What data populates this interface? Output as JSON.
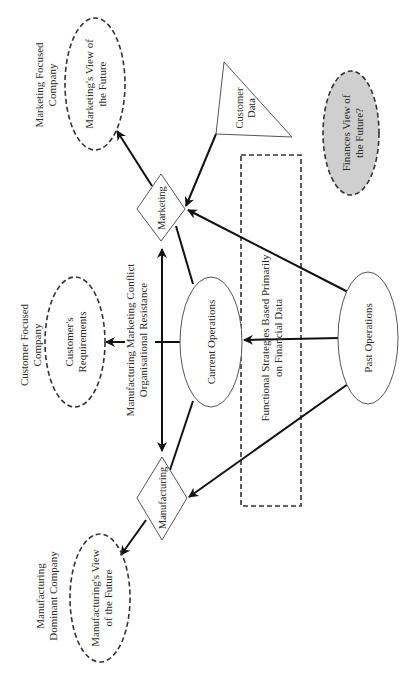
{
  "diagram": {
    "orientation": "rotated-90-ccw",
    "colors": {
      "background": "#ffffff",
      "line": "#111111",
      "finance_fill": "#cfcfcf"
    },
    "company_labels": {
      "marketing": [
        "Marketing Focused",
        "Company"
      ],
      "customer": [
        "Customer Focused",
        "Company"
      ],
      "manufacturing": [
        "Manufacturing",
        "Dominant Company"
      ]
    },
    "views": {
      "marketing": [
        "Marketing's View of",
        "the Future"
      ],
      "customer": [
        "Customer's",
        "Requirements"
      ],
      "manufacturing": [
        "Manufacturing's View",
        "of the Future"
      ],
      "finance": [
        "Finances View of",
        "the Future?"
      ]
    },
    "nodes": {
      "marketing": "Marketing",
      "manufacturing": "Manufacturing",
      "current_operations": "Current Operations",
      "past_operations": "Past Operations",
      "customer_data": [
        "Customer",
        "Data"
      ]
    },
    "conflict_label": [
      "Manufacturing Marketing Conflict",
      "Organisational Resistance"
    ],
    "strategy_label": [
      "Functional Strategies Based Primarily",
      "on Financial Data"
    ]
  }
}
